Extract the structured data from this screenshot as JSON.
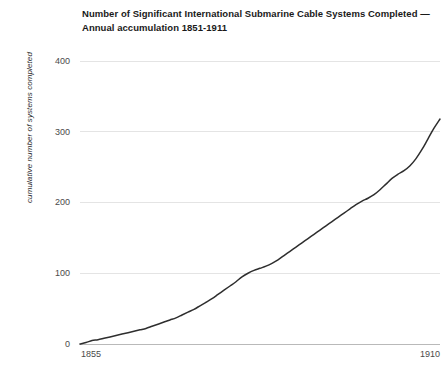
{
  "chart_data": {
    "type": "line",
    "title": "Number of Significant International Submarine Cable Systems Completed — Annual accumulation 1851-1911",
    "title_line1": "Number of Significant International Submarine Cable Systems Completed —",
    "title_line2": "Annual accumulation 1851-1911",
    "xlabel": "",
    "ylabel": "cumulative number of systems completed",
    "xlim": [
      1851,
      1911
    ],
    "ylim": [
      0,
      400
    ],
    "grid": true,
    "legend": "none",
    "line_color": "#2e2e2e",
    "grid_color": "#e4e4e4",
    "axis_color": "#b9b9b9",
    "ytick_labels": [
      "0",
      "100",
      "200",
      "300",
      "400"
    ],
    "ytick_values": [
      0,
      100,
      200,
      300,
      400
    ],
    "xtick_labels": [
      "1855",
      "1910"
    ],
    "xtick_values": [
      1855,
      1910
    ],
    "series": [
      {
        "name": "cumulative systems completed",
        "x": [
          1851,
          1852,
          1853,
          1854,
          1855,
          1856,
          1857,
          1858,
          1859,
          1860,
          1861,
          1862,
          1863,
          1864,
          1865,
          1866,
          1867,
          1868,
          1869,
          1870,
          1871,
          1872,
          1873,
          1874,
          1875,
          1876,
          1877,
          1878,
          1879,
          1880,
          1881,
          1882,
          1883,
          1884,
          1885,
          1886,
          1887,
          1888,
          1889,
          1890,
          1891,
          1892,
          1893,
          1894,
          1895,
          1896,
          1897,
          1898,
          1899,
          1900,
          1901,
          1902,
          1903,
          1904,
          1905,
          1906,
          1907,
          1908,
          1909,
          1910,
          1911
        ],
        "values": [
          0,
          2,
          5,
          6,
          8,
          10,
          12,
          14,
          16,
          18,
          20,
          22,
          25,
          28,
          31,
          34,
          37,
          41,
          45,
          49,
          54,
          59,
          64,
          70,
          76,
          82,
          88,
          95,
          100,
          104,
          107,
          110,
          114,
          119,
          125,
          131,
          137,
          143,
          149,
          155,
          161,
          167,
          173,
          179,
          185,
          191,
          197,
          202,
          206,
          211,
          218,
          226,
          234,
          240,
          245,
          252,
          262,
          275,
          290,
          305,
          318
        ]
      }
    ]
  }
}
